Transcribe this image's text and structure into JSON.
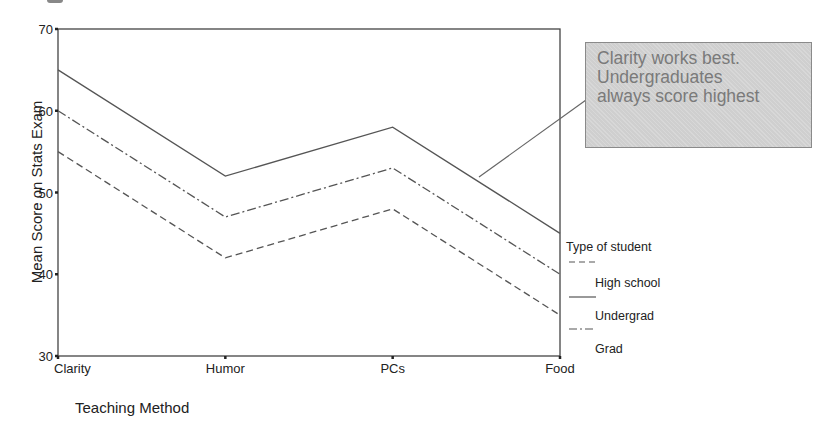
{
  "chart_data": {
    "type": "line",
    "title": "",
    "xlabel": "Teaching Method",
    "ylabel": "Mean Score on Stats Exam",
    "categories": [
      "Clarity",
      "Humor",
      "PCs",
      "Food"
    ],
    "ylim": [
      30,
      70
    ],
    "yticks": [
      "30",
      "40",
      "50",
      "60",
      "70"
    ],
    "grid": false,
    "legend_position": "right",
    "legend_title": "Type of student",
    "series": [
      {
        "name": "High school",
        "line_style": "dashed",
        "values": [
          55,
          42,
          48,
          35
        ]
      },
      {
        "name": "Undergrad",
        "line_style": "solid",
        "values": [
          65,
          52,
          58,
          45
        ]
      },
      {
        "name": "Grad",
        "line_style": "dash-dot",
        "values": [
          60,
          47,
          53,
          40
        ]
      }
    ],
    "annotation": {
      "lines": [
        "Clarity works best.",
        "Undergraduates",
        "always score highest"
      ],
      "points_to": "Undergrad"
    }
  },
  "colors": {
    "line": "#555555",
    "axis": "#333333",
    "annotation_fill": "#cfcfcf",
    "annotation_text": "#7a7a7a"
  }
}
